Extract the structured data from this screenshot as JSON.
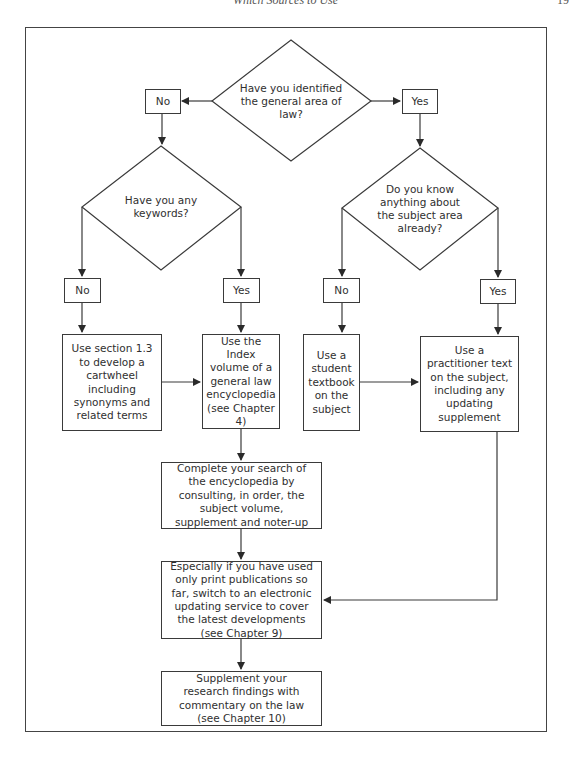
{
  "page": {
    "running_head": "Which Sources to Use",
    "page_number": "19"
  },
  "colors": {
    "line": "#3a3a3a",
    "text": "#2f2f2f",
    "background": "#ffffff"
  },
  "flowchart": {
    "decisions": {
      "general_area": "Have you identified the general area of law?",
      "keywords": "Have you any keywords?",
      "know_subject": "Do you know anything about the subject area already?"
    },
    "answers": {
      "general_area_no": "No",
      "general_area_yes": "Yes",
      "keywords_no": "No",
      "keywords_yes": "Yes",
      "know_subject_no": "No",
      "know_subject_yes": "Yes"
    },
    "actions": {
      "cartwheel": "Use section 1.3 to develop a cartwheel including synonyms and related terms",
      "index_volume": "Use the Index volume of a general law encyclopedia (see Chapter 4)",
      "student_textbook": "Use a student textbook on the subject",
      "practitioner_text": "Use a practitioner text on the subject, including any updating supplement",
      "complete_search": "Complete your search of the encyclopedia by consulting, in order, the subject volume, supplement and noter-up",
      "electronic_updating": "Especially if you have used only print publications so far, switch to an electronic updating service to cover the latest developments (see Chapter 9)",
      "supplement_findings": "Supplement your research findings with commentary on the law (see Chapter 10)"
    }
  }
}
